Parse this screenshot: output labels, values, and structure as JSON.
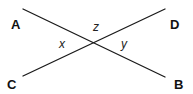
{
  "diagram": {
    "type": "intersecting-lines",
    "colors": {
      "line": "#1a1a1a",
      "text": "#111111",
      "background": "#ffffff"
    },
    "lines": [
      {
        "name": "AB",
        "from": [
          23,
          9
        ],
        "to": [
          165,
          77
        ]
      },
      {
        "name": "CD",
        "from": [
          23,
          76
        ],
        "to": [
          165,
          9
        ]
      }
    ],
    "intersection": [
      94,
      43
    ],
    "points": {
      "A": "A",
      "B": "B",
      "C": "C",
      "D": "D"
    },
    "angles": {
      "x": "x",
      "y": "y",
      "z": "z"
    }
  }
}
